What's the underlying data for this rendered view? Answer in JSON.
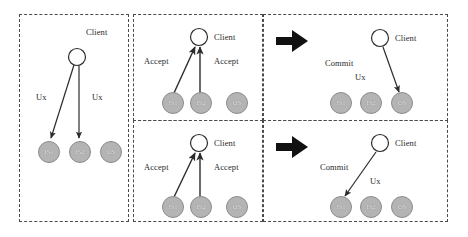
{
  "figure": {
    "type": "protocol-flow-diagram",
    "node_labels": {
      "client": "Client",
      "is1": "IS1",
      "is2": "IS2",
      "os": "OS"
    },
    "message_labels": {
      "ux": "Ux",
      "accept": "Accept",
      "commit": "Commit"
    },
    "colors": {
      "node_fill": "#b4b4b4",
      "node_stroke": "#8c8c8c",
      "node_text": "#efefef",
      "client_fill": "#ffffff",
      "client_stroke": "#2b2b2b",
      "arrow_stroke": "#2b2b2b",
      "block_arrow": "#111111",
      "panel_border": "#4a4a4a",
      "text": "#2b2b2b",
      "background": "#ffffff"
    }
  },
  "panels": [
    {
      "id": "panel-broadcast",
      "position": "left",
      "client": "Client",
      "nodes": [
        "IS1",
        "IS2",
        "OS"
      ],
      "edge_labels": [
        "Ux",
        "Ux"
      ],
      "edges": [
        {
          "from": "Client",
          "to": "IS1",
          "label": "Ux"
        },
        {
          "from": "Client",
          "to": "IS2",
          "label": "Ux"
        }
      ]
    },
    {
      "id": "panel-accept-top",
      "position": "middle-top",
      "client": "Client",
      "nodes": [
        "IS1",
        "IS2",
        "OS"
      ],
      "edge_labels": [
        "Accept",
        "Accept"
      ],
      "edges": [
        {
          "from": "IS1",
          "to": "Client",
          "label": "Accept"
        },
        {
          "from": "IS2",
          "to": "Client",
          "label": "Accept"
        }
      ]
    },
    {
      "id": "panel-commit-os",
      "position": "right-top",
      "client": "Client",
      "nodes": [
        "IS1",
        "IS2",
        "OS"
      ],
      "edge_labels": [
        "Commit",
        "Ux"
      ],
      "edges": [
        {
          "from": "Client",
          "to": "OS",
          "label": "Ux"
        }
      ]
    },
    {
      "id": "panel-accept-bottom",
      "position": "middle-bottom",
      "client": "Client",
      "nodes": [
        "IS1",
        "IS2",
        "OS"
      ],
      "edge_labels": [
        "Accept",
        "Accept"
      ],
      "edges": [
        {
          "from": "IS1",
          "to": "Client",
          "label": "Accept"
        },
        {
          "from": "IS2",
          "to": "Client",
          "label": "Accept"
        }
      ]
    },
    {
      "id": "panel-commit-is1",
      "position": "right-bottom",
      "client": "Client",
      "nodes": [
        "IS1",
        "IS2",
        "OS"
      ],
      "edge_labels": [
        "Commit",
        "Ux"
      ],
      "edges": [
        {
          "from": "Client",
          "to": "IS1",
          "label": "Ux"
        }
      ]
    }
  ],
  "transitions": [
    {
      "id": "arrow-top",
      "glyph": "block-arrow-right"
    },
    {
      "id": "arrow-bottom",
      "glyph": "block-arrow-right"
    }
  ],
  "labels": {
    "p1_client": "Client",
    "p1_ux_left": "Ux",
    "p1_ux_right": "Ux",
    "p1_is1": "IS1",
    "p1_is2": "IS2",
    "p1_os": "OS",
    "p2_client": "Client",
    "p2_accept_left": "Accept",
    "p2_accept_right": "Accept",
    "p2_is1": "IS1",
    "p2_is2": "IS2",
    "p2_os": "OS",
    "p3_client": "Client",
    "p3_commit": "Commit",
    "p3_ux": "Ux",
    "p3_is1": "IS1",
    "p3_is2": "IS2",
    "p3_os": "OS",
    "p4_client": "Client",
    "p4_accept_left": "Accept",
    "p4_accept_right": "Accept",
    "p4_is1": "IS1",
    "p4_is2": "IS2",
    "p4_os": "OS",
    "p5_client": "Client",
    "p5_commit": "Commit",
    "p5_ux": "Ux",
    "p5_is1": "IS1",
    "p5_is2": "IS2",
    "p5_os": "OS"
  }
}
